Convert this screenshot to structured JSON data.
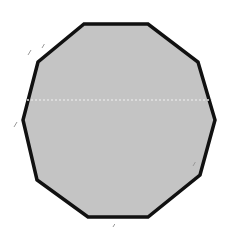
{
  "figure": {
    "shape": "decagon",
    "sides": 10,
    "fill_color": "#c4c4c4",
    "stroke_color": "#111111",
    "stroke_width": 3.5,
    "vertices": [
      [
        84,
        24
      ],
      [
        148,
        24
      ],
      [
        198,
        62
      ],
      [
        215,
        120
      ],
      [
        200,
        175
      ],
      [
        148,
        217
      ],
      [
        88,
        217
      ],
      [
        37,
        180
      ],
      [
        23,
        120
      ],
      [
        38,
        62
      ]
    ],
    "midline": {
      "y": 100,
      "x1": 27,
      "x2": 212,
      "color": "#e2e2e2",
      "style": "dashed"
    }
  },
  "specks": [
    {
      "x": 28,
      "y": 50,
      "len": 5
    },
    {
      "x": 42,
      "y": 44,
      "len": 4
    },
    {
      "x": 14,
      "y": 122,
      "len": 5
    },
    {
      "x": 193,
      "y": 162,
      "len": 4
    },
    {
      "x": 113,
      "y": 224,
      "len": 3
    }
  ]
}
